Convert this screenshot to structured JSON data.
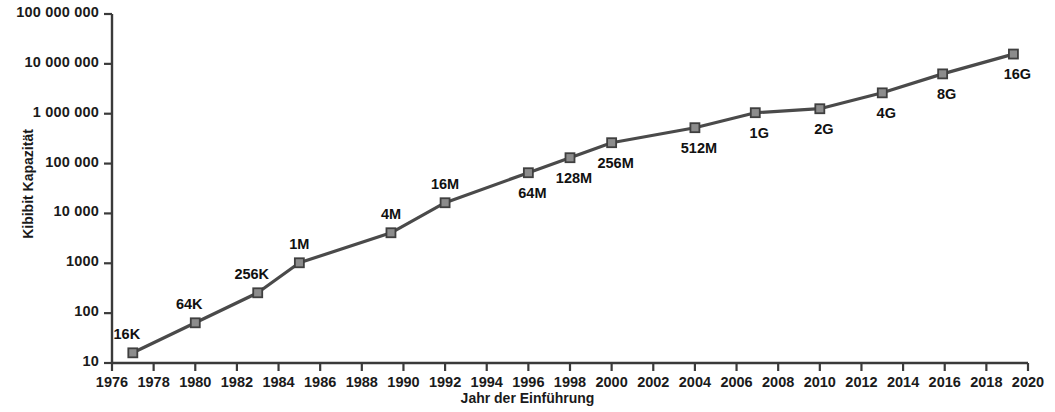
{
  "chart_data": {
    "type": "line",
    "title": "",
    "xlabel": "Jahr der Einführung",
    "ylabel": "Kibibit Kapazität",
    "yscale": "log",
    "ylim": [
      10,
      100000000
    ],
    "xlim": [
      1976,
      2020
    ],
    "grid": false,
    "legend": null,
    "y_ticks": [
      10,
      100,
      1000,
      10000,
      100000,
      1000000,
      10000000,
      100000000
    ],
    "y_tick_labels": [
      "10",
      "100",
      "1000",
      "10 000",
      "100 000",
      "1 000 000",
      "10 000 000",
      "100 000 000"
    ],
    "x_ticks": [
      1976,
      1978,
      1980,
      1982,
      1984,
      1986,
      1988,
      1990,
      1992,
      1994,
      1996,
      1998,
      2000,
      2002,
      2004,
      2006,
      2008,
      2010,
      2012,
      2014,
      2016,
      2018,
      2020
    ],
    "x_tick_labels": [
      "1976",
      "1978",
      "1980",
      "1982",
      "1984",
      "1986",
      "1988",
      "1990",
      "1992",
      "1994",
      "1996",
      "1998",
      "2000",
      "2002",
      "2004",
      "2006",
      "2008",
      "2010",
      "2012",
      "2014",
      "2016",
      "2018",
      "2020"
    ],
    "marker": "square",
    "marker_color": "#8c8c8c",
    "marker_edge_color": "#3f3f3f",
    "line_color": "#4a4a4a",
    "x": [
      1977,
      1980,
      1983,
      1985,
      1989.4,
      1992,
      1996,
      1998,
      2000,
      2004,
      2006.9,
      2010,
      2013,
      2015.9,
      2019.3
    ],
    "y": [
      16,
      64,
      256,
      1024,
      4096,
      16384,
      65536,
      131072,
      262144,
      524288,
      1048576,
      1258291,
      2621440,
      6291456,
      15728640
    ],
    "point_labels": [
      "16K",
      "64K",
      "256K",
      "1M",
      "4M",
      "16M",
      "64M",
      "128M",
      "256M",
      "512M",
      "1G",
      "2G",
      "4G",
      "8G",
      "16G"
    ],
    "label_positions": [
      "above-left",
      "above-left",
      "above-left",
      "above",
      "above",
      "above",
      "below",
      "below",
      "below",
      "below",
      "below",
      "below",
      "below",
      "below",
      "below"
    ]
  },
  "axes": {
    "y_title": "Kibibit Kapazität",
    "x_title": "Jahr der Einführung"
  }
}
